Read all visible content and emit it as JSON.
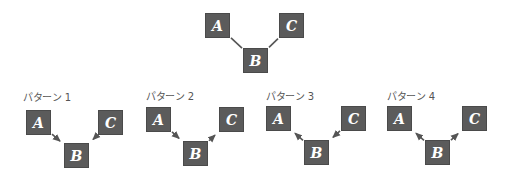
{
  "colors": {
    "node_fill": "#5b5b5b",
    "node_text": "#ffffff",
    "edge": "#555555",
    "label_text": "#555555",
    "background": "#ffffff"
  },
  "top_diagram": {
    "nodes": [
      {
        "id": "A",
        "label": "A",
        "x": 205,
        "y": 13
      },
      {
        "id": "C",
        "label": "C",
        "x": 279,
        "y": 13
      },
      {
        "id": "B",
        "label": "B",
        "x": 243,
        "y": 48
      }
    ],
    "edges": [
      {
        "from": "A",
        "to": "B",
        "arrow": "none"
      },
      {
        "from": "C",
        "to": "B",
        "arrow": "none"
      }
    ]
  },
  "patterns": [
    {
      "label": "パターン 1",
      "label_x": 23,
      "label_y": 92,
      "nodes": [
        {
          "id": "A",
          "label": "A",
          "x": 26,
          "y": 110
        },
        {
          "id": "C",
          "label": "C",
          "x": 98,
          "y": 110
        },
        {
          "id": "B",
          "label": "B",
          "x": 64,
          "y": 143
        }
      ],
      "edges": [
        {
          "from": "A",
          "to": "B",
          "arrow": "end"
        },
        {
          "from": "C",
          "to": "B",
          "arrow": "end"
        }
      ]
    },
    {
      "label": "パターン 2",
      "label_x": 146,
      "label_y": 91,
      "nodes": [
        {
          "id": "A",
          "label": "A",
          "x": 146,
          "y": 107
        },
        {
          "id": "C",
          "label": "C",
          "x": 219,
          "y": 107
        },
        {
          "id": "B",
          "label": "B",
          "x": 183,
          "y": 141
        }
      ],
      "edges": [
        {
          "from": "A",
          "to": "B",
          "arrow": "end"
        },
        {
          "from": "B",
          "to": "C",
          "arrow": "end"
        }
      ]
    },
    {
      "label": "パターン 3",
      "label_x": 266,
      "label_y": 91,
      "nodes": [
        {
          "id": "A",
          "label": "A",
          "x": 266,
          "y": 106
        },
        {
          "id": "C",
          "label": "C",
          "x": 341,
          "y": 106
        },
        {
          "id": "B",
          "label": "B",
          "x": 304,
          "y": 140
        }
      ],
      "edges": [
        {
          "from": "B",
          "to": "A",
          "arrow": "end"
        },
        {
          "from": "C",
          "to": "B",
          "arrow": "end"
        }
      ]
    },
    {
      "label": "パターン 4",
      "label_x": 387,
      "label_y": 91,
      "nodes": [
        {
          "id": "A",
          "label": "A",
          "x": 387,
          "y": 106
        },
        {
          "id": "C",
          "label": "C",
          "x": 462,
          "y": 106
        },
        {
          "id": "B",
          "label": "B",
          "x": 425,
          "y": 140
        }
      ],
      "edges": [
        {
          "from": "B",
          "to": "A",
          "arrow": "end"
        },
        {
          "from": "B",
          "to": "C",
          "arrow": "end"
        }
      ]
    }
  ]
}
